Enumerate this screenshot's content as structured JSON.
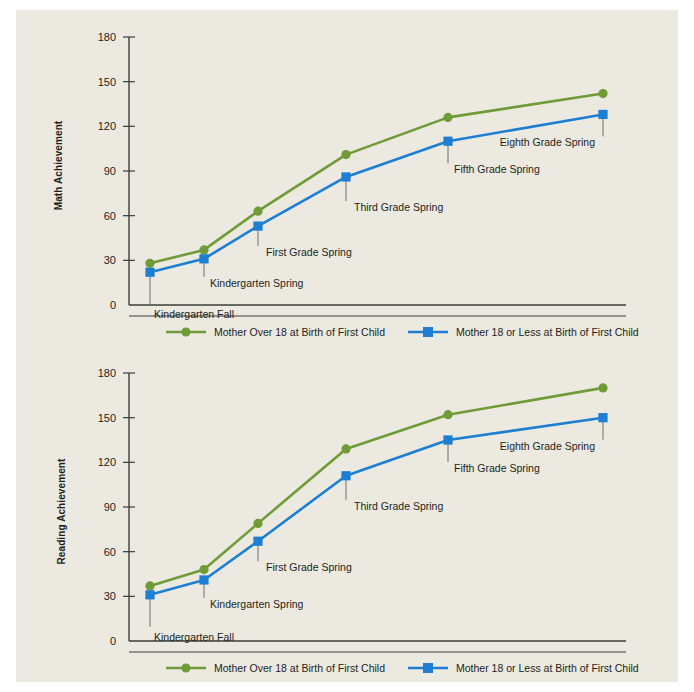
{
  "figure": {
    "background_color": "#ebe9e0",
    "page_background": "#ffffff"
  },
  "colors": {
    "series_over18": "#6f9c36",
    "series_18orless": "#1d7fd4",
    "axis": "#3d3d3a",
    "text": "#231f20"
  },
  "legend": {
    "over18_label": "Mother Over 18 at Birth of First Child",
    "under18_label": "Mother 18 or Less at Birth of First Child",
    "over18_marker": "circle-marker",
    "under18_marker": "square-marker"
  },
  "panels": [
    {
      "id": "math",
      "ylabel": "Math Achievement",
      "yticks": [
        "180",
        "150",
        "120",
        "90",
        "60",
        "30",
        "0"
      ]
    },
    {
      "id": "reading",
      "ylabel": "Reading Achievement",
      "yticks": [
        "180",
        "150",
        "120",
        "90",
        "60",
        "30",
        "0"
      ]
    }
  ],
  "point_labels": [
    "Kindergarten Fall",
    "Kindergarten Spring",
    "First Grade Spring",
    "Third Grade Spring",
    "Fifth Grade Spring",
    "Eighth Grade Spring"
  ],
  "chart_data": [
    {
      "type": "line",
      "title": "",
      "xlabel": "",
      "ylabel": "Math Achievement",
      "ylim": [
        0,
        180
      ],
      "ytick_values": [
        0,
        30,
        60,
        90,
        120,
        150,
        180
      ],
      "grid": false,
      "legend_position": "bottom",
      "categories": [
        "Kindergarten Fall",
        "Kindergarten Spring",
        "First Grade Spring",
        "Third Grade Spring",
        "Fifth Grade Spring",
        "Eighth Grade Spring"
      ],
      "series": [
        {
          "name": "Mother Over 18 at Birth of First Child",
          "color": "#6f9c36",
          "marker": "circle",
          "values": [
            28,
            37,
            63,
            101,
            126,
            142
          ]
        },
        {
          "name": "Mother 18 or Less at Birth of First Child",
          "color": "#1d7fd4",
          "marker": "square",
          "values": [
            22,
            31,
            53,
            86,
            110,
            128
          ]
        }
      ]
    },
    {
      "type": "line",
      "title": "",
      "xlabel": "",
      "ylabel": "Reading Achievement",
      "ylim": [
        0,
        180
      ],
      "ytick_values": [
        0,
        30,
        60,
        90,
        120,
        150,
        180
      ],
      "grid": false,
      "legend_position": "bottom",
      "categories": [
        "Kindergarten Fall",
        "Kindergarten Spring",
        "First Grade Spring",
        "Third Grade Spring",
        "Fifth Grade Spring",
        "Eighth Grade Spring"
      ],
      "series": [
        {
          "name": "Mother Over 18 at Birth of First Child",
          "color": "#6f9c36",
          "marker": "circle",
          "values": [
            37,
            48,
            79,
            129,
            152,
            170
          ]
        },
        {
          "name": "Mother 18 or Less at Birth of First Child",
          "color": "#1d7fd4",
          "marker": "square",
          "values": [
            31,
            41,
            67,
            111,
            135,
            150
          ]
        }
      ]
    }
  ]
}
